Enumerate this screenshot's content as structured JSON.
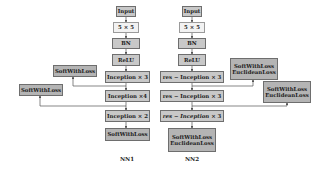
{
  "diagram": {
    "networks": [
      {
        "name": "NN1",
        "layers": [
          "Input",
          "5 × 5",
          "BN",
          "ReLU",
          "Inception  × 3",
          "Inception  ×4",
          "Inception  × 2",
          "SoftWithLoss"
        ],
        "aux_outputs": [
          {
            "label": "SoftWithLoss",
            "from_layer": "Inception  × 3"
          },
          {
            "label": "SoftWithLoss",
            "from_layer": "Inception  ×4"
          }
        ]
      },
      {
        "name": "NN2",
        "layers": [
          "Input",
          "5 × 5",
          "BN",
          "ReLU",
          "res − Inception  × 3",
          "res − Inception  × 3",
          "res − Inception  × 3",
          "SoftWithLoss / EuclideanLoss"
        ],
        "aux_outputs": [
          {
            "label": "SoftWithLoss / EuclideanLoss",
            "from_layer": "res − Inception  × 3 (1)"
          },
          {
            "label": "SoftWithLoss / EuclideanLoss",
            "from_layer": "res − Inception  × 3 (2)"
          }
        ]
      }
    ],
    "nn1": {
      "title": "NN1",
      "input": "Input",
      "conv": "5 × 5",
      "bn": "BN",
      "relu": "ReLU",
      "inc1": "Inception  × 3",
      "inc2": "Inception  ×4",
      "inc3": "Inception  × 2",
      "out": "SoftWithLoss",
      "aux1": "SoftWithLoss",
      "aux2": "SoftWithLoss"
    },
    "nn2": {
      "title": "NN2",
      "input": "Input",
      "conv": "5 × 5",
      "bn": "BN",
      "relu": "ReLU",
      "inc1": "res − Inception  × 3",
      "inc2": "res − Inception  × 3",
      "inc3_prefix": "res − Inception",
      "inc3_suffix": " × 3",
      "out_line1": "SoftWithLoss",
      "out_line2": "EuclideanLoss",
      "aux1_line1": "SoftWithLoss",
      "aux1_line2": "EuclideanLoss",
      "aux2_line1": "SoftWithLoss",
      "aux2_line2": "EuclideanLoss"
    },
    "colors": {
      "box_fill": "#c8c8c8",
      "light_box_fill": "#f2f2f2",
      "border": "#6e6e6e",
      "arrow": "#555555"
    }
  }
}
